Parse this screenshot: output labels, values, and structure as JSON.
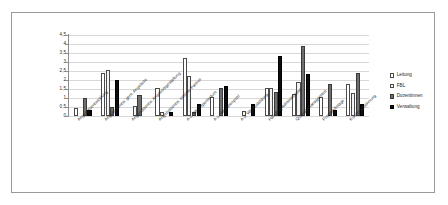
{
  "chart_data": {
    "type": "bar",
    "title": "",
    "xlabel": "",
    "ylabel": "",
    "ylim": [
      0,
      4.5
    ],
    "ytick_step": 0.5,
    "grid": true,
    "legend_position": "right",
    "ytick_labels": [
      "4,5",
      "4",
      "3,5",
      "3",
      "2,5",
      "2",
      "1,5",
      "1",
      "0,5",
      "0"
    ],
    "categories": [
      "Angebotsentwicklung",
      "Angebotsentw. gem. Angebote",
      "Angebotsentw. Angebotsgestaltung",
      "Angebotsentw. externe Partner",
      "A u. Wb Expertentum",
      "A u. Wb Ideenpool",
      "A u. Wb Ausbildung",
      "Handling Administration",
      "Qualitätsmanagement",
      "Prestige/Image",
      "Kundengewinnung"
    ],
    "series": [
      {
        "name": "Leitung",
        "color": "#ffffff",
        "values": [
          0.42,
          2.4,
          0.0,
          1.58,
          3.2,
          1.03,
          0.0,
          1.57,
          1.22,
          1.05,
          1.78
        ]
      },
      {
        "name": "FBL",
        "color": "#f2f2f2",
        "values": [
          0.0,
          2.55,
          0.55,
          0.22,
          2.22,
          0.0,
          0.27,
          1.57,
          1.88,
          0.0,
          1.28
        ]
      },
      {
        "name": "Dozentinnen",
        "color": "#6e6e6e",
        "values": [
          1.02,
          0.52,
          1.17,
          0.0,
          0.2,
          1.57,
          0.0,
          1.36,
          3.87,
          1.8,
          2.4
        ]
      },
      {
        "name": "Verwaltung",
        "color": "#0d0d0d",
        "values": [
          0.32,
          1.98,
          0.0,
          0.2,
          0.67,
          1.67,
          0.67,
          3.35,
          2.35,
          0.33,
          0.68
        ]
      }
    ]
  },
  "legend": {
    "items": [
      {
        "label": "Leitung"
      },
      {
        "label": "FBL"
      },
      {
        "label": "Dozentinnen"
      },
      {
        "label": "Verwaltung"
      }
    ]
  }
}
